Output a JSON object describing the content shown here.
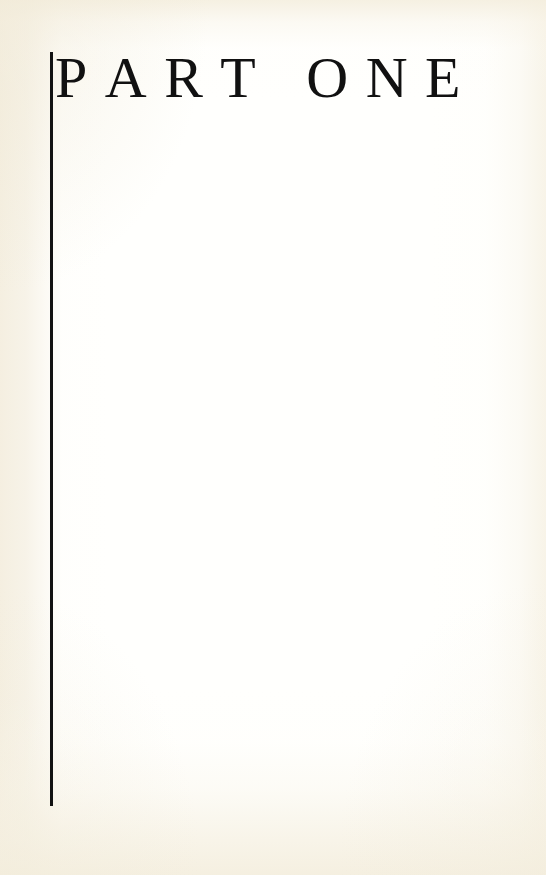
{
  "page": {
    "kind": "book-part-title-page",
    "background_color": "#fffffd",
    "paper_tint_color": "#f4eede",
    "ink_color": "#121212"
  },
  "heading": {
    "full_text": "PART ONE",
    "words": [
      {
        "text": "PART",
        "letters": [
          "P",
          "A",
          "R",
          "T"
        ]
      },
      {
        "text": "ONE",
        "letters": [
          "O",
          "N",
          "E"
        ]
      }
    ]
  },
  "rule": {
    "orientation": "vertical",
    "color": "#121212",
    "thickness_px": 3,
    "top_px": 52,
    "bottom_px": 806,
    "left_px": 50
  },
  "body": {
    "content": ""
  }
}
